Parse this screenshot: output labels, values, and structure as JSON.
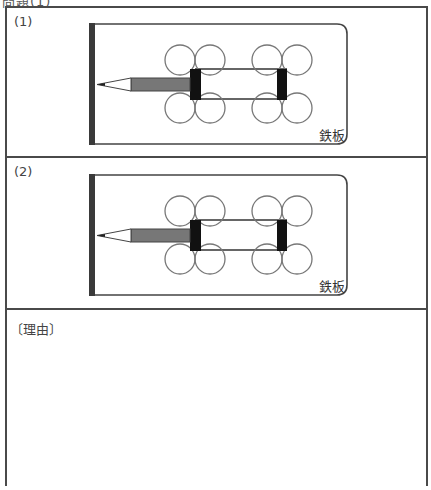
{
  "header": {
    "text": "問題(1)"
  },
  "questions": [
    {
      "label": "(1)",
      "diagram": {
        "plate_label": "鉄板",
        "colors": {
          "wall": "#3a3a3a",
          "pencil_body": "#777777",
          "block": "#111111",
          "outline": "#444444",
          "wheel": "#777777"
        }
      }
    },
    {
      "label": "(2)",
      "diagram": {
        "plate_label": "鉄板",
        "colors": {
          "wall": "#3a3a3a",
          "pencil_body": "#777777",
          "block": "#111111",
          "outline": "#444444",
          "wheel": "#777777"
        }
      }
    }
  ],
  "reason": {
    "label": "〔理由〕",
    "answer": ""
  }
}
